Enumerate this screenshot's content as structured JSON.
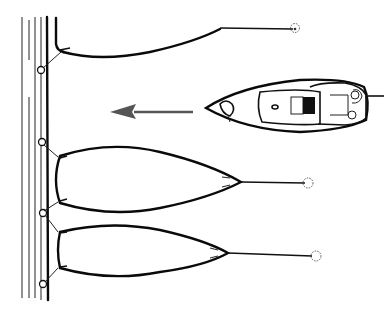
{
  "figure": {
    "title": "",
    "colors": {
      "background": "#ffffff",
      "ink": "#111111",
      "arrow": "#555555",
      "cockpit_fill": "#111111"
    },
    "elements": {
      "dock": {
        "label": "",
        "posts": 4
      },
      "moored_boats": [
        {
          "id": "top-boat",
          "mooring_buoy": true
        },
        {
          "id": "middle-boat",
          "mooring_buoy": true
        },
        {
          "id": "bottom-boat",
          "mooring_buoy": true
        }
      ],
      "approaching_boat": {
        "direction": "left",
        "stern_line": true
      },
      "arrow": {
        "direction": "left"
      }
    }
  }
}
